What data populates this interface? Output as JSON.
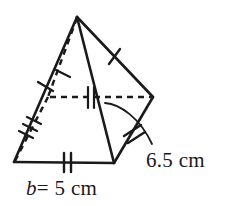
{
  "figure": {
    "name": "square-pyramid-diagram",
    "kind": "geometry-solid",
    "solid": "square pyramid",
    "stroke_color": "#1a1a1a",
    "background_color": "#ffffff",
    "labels": {
      "base": {
        "variable": "b",
        "equals": "=",
        "value": "5",
        "unit": "cm",
        "full_text": "b = 5 cm"
      },
      "slant": {
        "value": "6.5",
        "unit": "cm",
        "full_text": "6.5 cm"
      }
    },
    "vertices": {
      "apex": {
        "x": 77,
        "y": 17
      },
      "front_left": {
        "x": 14,
        "y": 162
      },
      "front_right": {
        "x": 114,
        "y": 163
      },
      "right": {
        "x": 153,
        "y": 97
      },
      "back_hidden": {
        "x": 48,
        "y": 97
      }
    },
    "edges": [
      {
        "name": "apex-to-front-left",
        "style": "solid",
        "ticks": 1
      },
      {
        "name": "apex-to-front-right",
        "style": "solid",
        "ticks": 0
      },
      {
        "name": "apex-to-right",
        "style": "solid",
        "ticks": 1
      },
      {
        "name": "apex-to-back-hidden",
        "style": "dashed",
        "ticks": 1
      },
      {
        "name": "base-front",
        "style": "solid",
        "ticks": 2
      },
      {
        "name": "base-front-right-to-right",
        "style": "solid",
        "ticks": 2
      },
      {
        "name": "base-back-left-hidden",
        "style": "dashed",
        "ticks": 3
      },
      {
        "name": "base-back-right-hidden",
        "style": "dashed",
        "ticks": 2
      }
    ],
    "leader": {
      "name": "slant-height-leader",
      "from": {
        "x": 105,
        "y": 103
      },
      "to": {
        "x": 160,
        "y": 143
      }
    }
  }
}
